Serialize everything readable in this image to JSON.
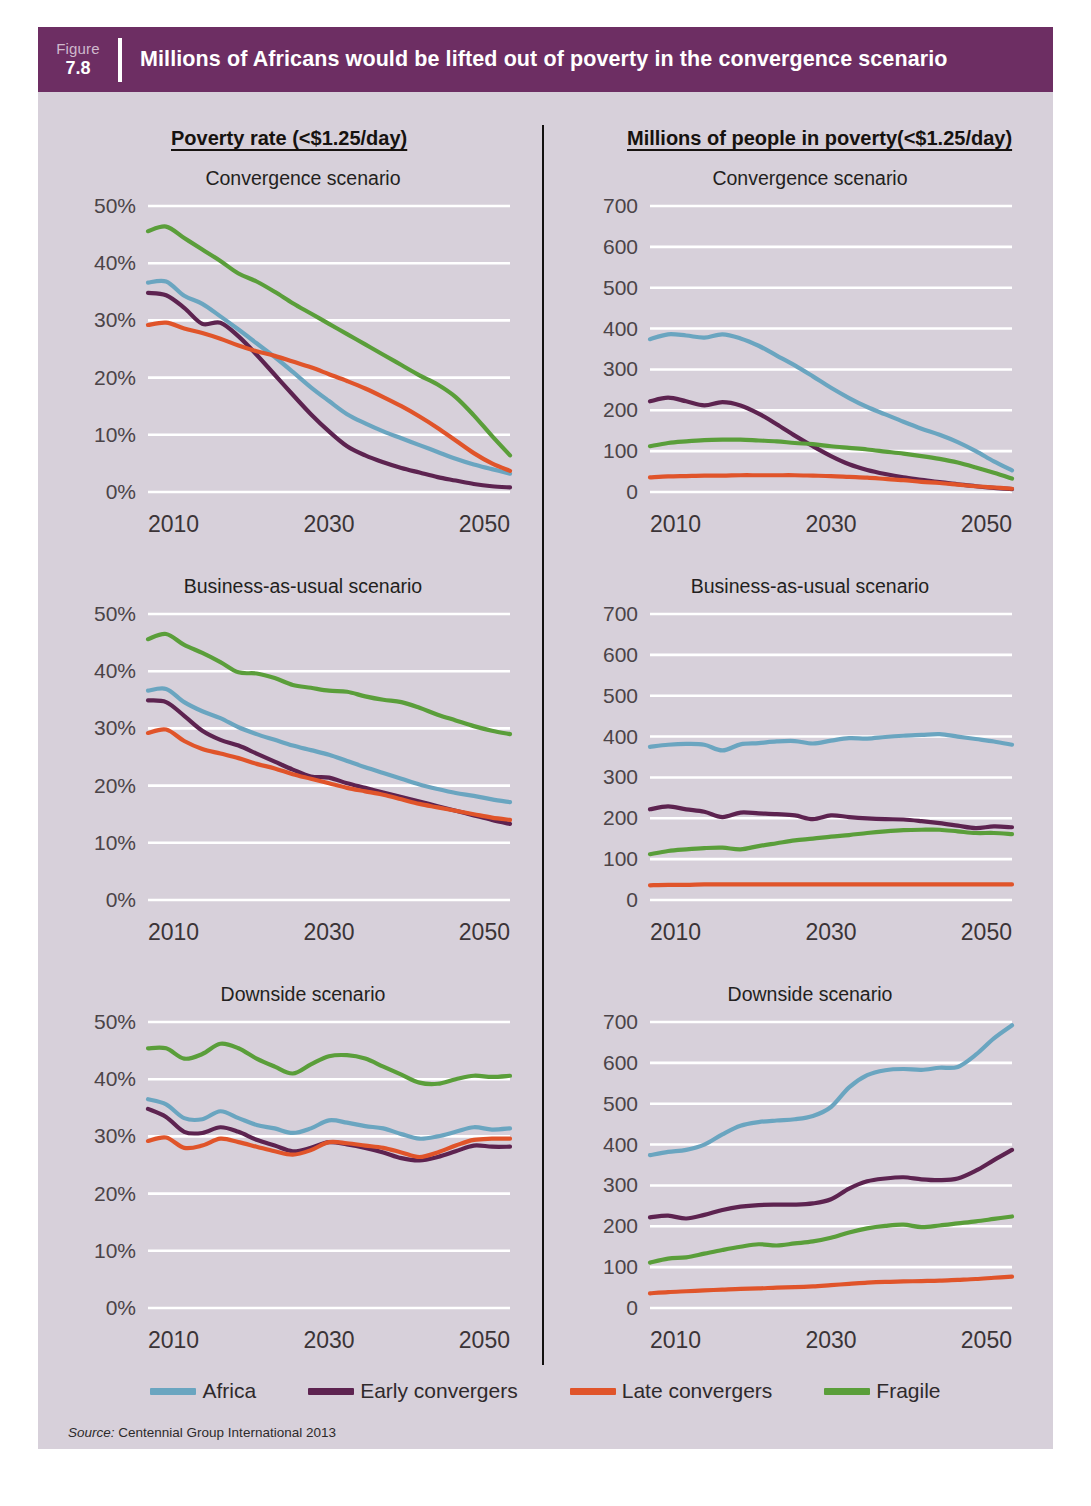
{
  "figure": {
    "label": "Figure",
    "number": "7.8",
    "title": "Millions of Africans would be lifted out of poverty in the convergence scenario",
    "header_color": "#6d2e63",
    "background_color": "#d7d0da",
    "source": "Centennial Group International 2013",
    "source_prefix": "Source:"
  },
  "columns": [
    {
      "title": "Poverty rate (<$1.25/day)"
    },
    {
      "title": "Millions of people in poverty(<$1.25/day)"
    }
  ],
  "legend": {
    "position": "bottom",
    "items": [
      {
        "label": "Africa",
        "color": "#6aa5c0"
      },
      {
        "label": "Early convergers",
        "color": "#5d2350"
      },
      {
        "label": "Late convergers",
        "color": "#e0542a"
      },
      {
        "label": "Fragile",
        "color": "#5a9e3a"
      }
    ]
  },
  "chart_data": [
    {
      "id": "poverty-rate-convergence",
      "type": "line",
      "title": "Convergence scenario",
      "column": "Poverty rate (<$1.25/day)",
      "xlabel": "",
      "ylabel": "",
      "xlim": [
        2010,
        2050
      ],
      "ylim": [
        0,
        50
      ],
      "xticks": [
        2010,
        2030,
        2050
      ],
      "xticklabels": [
        "2010",
        "2030",
        "2050"
      ],
      "yticks": [
        0,
        10,
        20,
        30,
        40,
        50
      ],
      "yticklabels": [
        "0%",
        "10%",
        "20%",
        "30%",
        "40%",
        "50%"
      ],
      "grid": true,
      "x": [
        2010,
        2012,
        2014,
        2016,
        2018,
        2020,
        2022,
        2024,
        2026,
        2028,
        2030,
        2032,
        2034,
        2036,
        2038,
        2040,
        2042,
        2044,
        2046,
        2048,
        2050
      ],
      "series": [
        {
          "name": "Africa",
          "color": "#6aa5c0",
          "values": [
            36.6,
            36.8,
            34.3,
            32.9,
            30.7,
            28.4,
            26.0,
            23.6,
            21.0,
            18.3,
            15.9,
            13.6,
            12.0,
            10.6,
            9.4,
            8.2,
            7.0,
            5.8,
            4.8,
            4.0,
            3.2
          ]
        },
        {
          "name": "Early convergers",
          "color": "#5d2350",
          "values": [
            34.8,
            34.4,
            32.2,
            29.4,
            29.6,
            27.2,
            24.0,
            20.5,
            17.0,
            13.6,
            10.6,
            8.0,
            6.4,
            5.2,
            4.2,
            3.4,
            2.6,
            2.0,
            1.4,
            1.0,
            0.8
          ]
        },
        {
          "name": "Late convergers",
          "color": "#e0542a",
          "values": [
            29.2,
            29.6,
            28.6,
            27.8,
            26.8,
            25.6,
            24.6,
            23.8,
            22.8,
            21.8,
            20.6,
            19.4,
            18.1,
            16.6,
            15.0,
            13.2,
            11.2,
            9.0,
            6.8,
            5.0,
            3.7
          ]
        },
        {
          "name": "Fragile",
          "color": "#5a9e3a",
          "values": [
            45.6,
            46.4,
            44.4,
            42.4,
            40.4,
            38.2,
            36.8,
            35.0,
            33.0,
            31.2,
            29.4,
            27.6,
            25.8,
            24.0,
            22.2,
            20.4,
            18.8,
            16.6,
            13.4,
            9.8,
            6.4
          ]
        }
      ]
    },
    {
      "id": "millions-convergence",
      "type": "line",
      "title": "Convergence scenario",
      "column": "Millions of people in poverty(<$1.25/day)",
      "xlabel": "",
      "ylabel": "",
      "xlim": [
        2010,
        2050
      ],
      "ylim": [
        0,
        700
      ],
      "xticks": [
        2010,
        2030,
        2050
      ],
      "xticklabels": [
        "2010",
        "2030",
        "2050"
      ],
      "yticks": [
        0,
        100,
        200,
        300,
        400,
        500,
        600,
        700
      ],
      "yticklabels": [
        "0",
        "100",
        "200",
        "300",
        "400",
        "500",
        "600",
        "700"
      ],
      "grid": true,
      "x": [
        2010,
        2012,
        2014,
        2016,
        2018,
        2020,
        2022,
        2024,
        2026,
        2028,
        2030,
        2032,
        2034,
        2036,
        2038,
        2040,
        2042,
        2044,
        2046,
        2048,
        2050
      ],
      "series": [
        {
          "name": "Africa",
          "color": "#6aa5c0",
          "values": [
            374,
            386,
            383,
            378,
            386,
            376,
            358,
            334,
            310,
            283,
            255,
            230,
            208,
            190,
            172,
            155,
            140,
            122,
            100,
            75,
            53
          ]
        },
        {
          "name": "Early convergers",
          "color": "#5d2350",
          "values": [
            222,
            231,
            222,
            212,
            220,
            212,
            192,
            166,
            138,
            112,
            88,
            68,
            54,
            44,
            36,
            30,
            24,
            19,
            14,
            10,
            7
          ]
        },
        {
          "name": "Late convergers",
          "color": "#e0542a",
          "values": [
            36,
            38,
            39,
            40,
            40,
            41,
            41,
            41,
            41,
            40,
            39,
            37,
            35,
            32,
            29,
            25,
            22,
            18,
            14,
            11,
            8
          ]
        },
        {
          "name": "Fragile",
          "color": "#5a9e3a",
          "values": [
            112,
            120,
            124,
            127,
            128,
            128,
            126,
            124,
            120,
            117,
            112,
            108,
            104,
            99,
            94,
            88,
            81,
            72,
            60,
            47,
            33
          ]
        }
      ]
    },
    {
      "id": "poverty-rate-bau",
      "type": "line",
      "title": "Business-as-usual scenario",
      "column": "Poverty rate (<$1.25/day)",
      "xlabel": "",
      "ylabel": "",
      "xlim": [
        2010,
        2050
      ],
      "ylim": [
        0,
        50
      ],
      "xticks": [
        2010,
        2030,
        2050
      ],
      "xticklabels": [
        "2010",
        "2030",
        "2050"
      ],
      "yticks": [
        0,
        10,
        20,
        30,
        40,
        50
      ],
      "yticklabels": [
        "0%",
        "10%",
        "20%",
        "30%",
        "40%",
        "50%"
      ],
      "grid": true,
      "x": [
        2010,
        2012,
        2014,
        2016,
        2018,
        2020,
        2022,
        2024,
        2026,
        2028,
        2030,
        2032,
        2034,
        2036,
        2038,
        2040,
        2042,
        2044,
        2046,
        2048,
        2050
      ],
      "series": [
        {
          "name": "Africa",
          "color": "#6aa5c0",
          "values": [
            36.6,
            36.9,
            34.6,
            33.0,
            31.8,
            30.2,
            29.0,
            28.0,
            27.0,
            26.2,
            25.4,
            24.3,
            23.2,
            22.2,
            21.2,
            20.2,
            19.4,
            18.7,
            18.2,
            17.6,
            17.1
          ]
        },
        {
          "name": "Early convergers",
          "color": "#5d2350",
          "values": [
            34.9,
            34.6,
            32.2,
            29.6,
            28.0,
            27.0,
            25.6,
            24.2,
            22.8,
            21.6,
            21.4,
            20.4,
            19.6,
            18.8,
            18.0,
            17.2,
            16.4,
            15.6,
            14.8,
            14.0,
            13.3
          ]
        },
        {
          "name": "Late convergers",
          "color": "#e0542a",
          "values": [
            29.2,
            29.8,
            27.8,
            26.4,
            25.6,
            24.8,
            23.8,
            23.0,
            22.0,
            21.2,
            20.4,
            19.6,
            19.0,
            18.4,
            17.6,
            16.8,
            16.2,
            15.6,
            15.0,
            14.4,
            14.0
          ]
        },
        {
          "name": "Fragile",
          "color": "#5a9e3a",
          "values": [
            45.6,
            46.5,
            44.6,
            43.2,
            41.6,
            39.8,
            39.6,
            38.8,
            37.6,
            37.1,
            36.6,
            36.4,
            35.6,
            35.0,
            34.6,
            33.6,
            32.4,
            31.4,
            30.4,
            29.6,
            29.0
          ]
        }
      ]
    },
    {
      "id": "millions-bau",
      "type": "line",
      "title": "Business-as-usual scenario",
      "column": "Millions of people in poverty(<$1.25/day)",
      "xlabel": "",
      "ylabel": "",
      "xlim": [
        2010,
        2050
      ],
      "ylim": [
        0,
        700
      ],
      "xticks": [
        2010,
        2030,
        2050
      ],
      "xticklabels": [
        "2010",
        "2030",
        "2050"
      ],
      "yticks": [
        0,
        100,
        200,
        300,
        400,
        500,
        600,
        700
      ],
      "yticklabels": [
        "0",
        "100",
        "200",
        "300",
        "400",
        "500",
        "600",
        "700"
      ],
      "grid": true,
      "x": [
        2010,
        2012,
        2014,
        2016,
        2018,
        2020,
        2022,
        2024,
        2026,
        2028,
        2030,
        2032,
        2034,
        2036,
        2038,
        2040,
        2042,
        2044,
        2046,
        2048,
        2050
      ],
      "series": [
        {
          "name": "Africa",
          "color": "#6aa5c0",
          "values": [
            375,
            380,
            382,
            380,
            366,
            381,
            384,
            388,
            389,
            383,
            390,
            396,
            395,
            399,
            402,
            404,
            406,
            400,
            394,
            388,
            380
          ]
        },
        {
          "name": "Early convergers",
          "color": "#5d2350",
          "values": [
            222,
            229,
            222,
            216,
            203,
            214,
            212,
            210,
            207,
            198,
            207,
            203,
            200,
            198,
            197,
            193,
            188,
            182,
            176,
            180,
            178
          ]
        },
        {
          "name": "Late convergers",
          "color": "#e0542a",
          "values": [
            36,
            37,
            37,
            38,
            38,
            38,
            38,
            38,
            38,
            38,
            38,
            38,
            38,
            38,
            38,
            38,
            38,
            38,
            38,
            38,
            38
          ]
        },
        {
          "name": "Fragile",
          "color": "#5a9e3a",
          "values": [
            112,
            120,
            124,
            127,
            128,
            124,
            132,
            139,
            146,
            150,
            155,
            159,
            164,
            168,
            171,
            172,
            172,
            168,
            164,
            164,
            161
          ]
        }
      ]
    },
    {
      "id": "poverty-rate-downside",
      "type": "line",
      "title": "Downside scenario",
      "column": "Poverty rate (<$1.25/day)",
      "xlabel": "",
      "ylabel": "",
      "xlim": [
        2010,
        2050
      ],
      "ylim": [
        0,
        50
      ],
      "xticks": [
        2010,
        2030,
        2050
      ],
      "xticklabels": [
        "2010",
        "2030",
        "2050"
      ],
      "yticks": [
        0,
        10,
        20,
        30,
        40,
        50
      ],
      "yticklabels": [
        "0%",
        "10%",
        "20%",
        "30%",
        "40%",
        "50%"
      ],
      "grid": true,
      "x": [
        2010,
        2012,
        2014,
        2016,
        2018,
        2020,
        2022,
        2024,
        2026,
        2028,
        2030,
        2032,
        2034,
        2036,
        2038,
        2040,
        2042,
        2044,
        2046,
        2048,
        2050
      ],
      "series": [
        {
          "name": "Africa",
          "color": "#6aa5c0",
          "values": [
            36.5,
            35.6,
            33.2,
            33.0,
            34.4,
            33.2,
            32.0,
            31.4,
            30.6,
            31.4,
            32.8,
            32.4,
            31.8,
            31.4,
            30.4,
            29.6,
            30.0,
            30.8,
            31.6,
            31.2,
            31.4
          ]
        },
        {
          "name": "Early convergers",
          "color": "#5d2350",
          "values": [
            34.8,
            33.4,
            30.8,
            30.6,
            31.6,
            30.8,
            29.4,
            28.4,
            27.4,
            28.0,
            29.0,
            28.6,
            28.0,
            27.2,
            26.2,
            25.8,
            26.4,
            27.4,
            28.4,
            28.2,
            28.2
          ]
        },
        {
          "name": "Late convergers",
          "color": "#e0542a",
          "values": [
            29.2,
            29.8,
            28.0,
            28.4,
            29.6,
            29.0,
            28.2,
            27.4,
            26.8,
            27.6,
            29.0,
            28.8,
            28.4,
            28.0,
            27.2,
            26.4,
            27.2,
            28.4,
            29.4,
            29.6,
            29.6
          ]
        },
        {
          "name": "Fragile",
          "color": "#5a9e3a",
          "values": [
            45.4,
            45.4,
            43.6,
            44.4,
            46.2,
            45.4,
            43.6,
            42.2,
            41.0,
            42.6,
            44.0,
            44.2,
            43.6,
            42.2,
            40.8,
            39.4,
            39.2,
            40.0,
            40.6,
            40.4,
            40.6
          ]
        }
      ]
    },
    {
      "id": "millions-downside",
      "type": "line",
      "title": "Downside scenario",
      "column": "Millions of people in poverty(<$1.25/day)",
      "xlabel": "",
      "ylabel": "",
      "xlim": [
        2010,
        2050
      ],
      "ylim": [
        0,
        700
      ],
      "xticks": [
        2010,
        2030,
        2050
      ],
      "xticklabels": [
        "2010",
        "2030",
        "2050"
      ],
      "yticks": [
        0,
        100,
        200,
        300,
        400,
        500,
        600,
        700
      ],
      "yticklabels": [
        "0",
        "100",
        "200",
        "300",
        "400",
        "500",
        "600",
        "700"
      ],
      "grid": true,
      "x": [
        2010,
        2012,
        2014,
        2016,
        2018,
        2020,
        2022,
        2024,
        2026,
        2028,
        2030,
        2032,
        2034,
        2036,
        2038,
        2040,
        2042,
        2044,
        2046,
        2048,
        2050
      ],
      "series": [
        {
          "name": "Africa",
          "color": "#6aa5c0",
          "values": [
            374,
            382,
            387,
            400,
            425,
            446,
            455,
            459,
            462,
            470,
            492,
            540,
            570,
            582,
            585,
            583,
            588,
            590,
            620,
            660,
            692
          ]
        },
        {
          "name": "Early convergers",
          "color": "#5d2350",
          "values": [
            222,
            226,
            219,
            228,
            240,
            248,
            252,
            253,
            253,
            256,
            266,
            292,
            310,
            317,
            320,
            315,
            313,
            317,
            336,
            362,
            387
          ]
        },
        {
          "name": "Late convergers",
          "color": "#e0542a",
          "values": [
            36,
            39,
            41,
            43,
            45,
            47,
            48,
            50,
            51,
            53,
            56,
            59,
            62,
            64,
            65,
            66,
            67,
            69,
            71,
            74,
            77
          ]
        },
        {
          "name": "Fragile",
          "color": "#5a9e3a",
          "values": [
            111,
            121,
            124,
            133,
            142,
            150,
            156,
            153,
            158,
            163,
            172,
            185,
            195,
            201,
            204,
            198,
            202,
            207,
            212,
            218,
            224
          ]
        }
      ]
    }
  ]
}
